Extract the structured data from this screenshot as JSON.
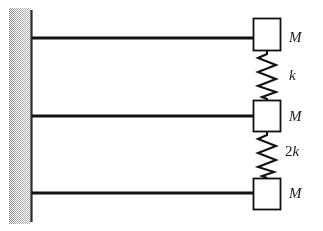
{
  "figure": {
    "background_color": "#ffffff",
    "ink_color": "#111111",
    "wall_hatch_color": "#9a9a9a",
    "width": 323,
    "height": 231
  },
  "wall": {
    "name": "fixed-wall",
    "line_x": 31,
    "line_top": 10,
    "line_bottom": 222,
    "hatch_side": "left",
    "hatch_width": 22
  },
  "rods": [
    {
      "label": "top-rod",
      "y": 38,
      "x_start": 31,
      "x_end": 270
    },
    {
      "label": "middle-rod",
      "y": 116,
      "x_start": 31,
      "x_end": 270
    },
    {
      "label": "bottom-rod",
      "y": 193,
      "x_start": 31,
      "x_end": 270
    }
  ],
  "masses": [
    {
      "id": "mass-top",
      "label": "M",
      "box": {
        "x": 253,
        "y": 18,
        "width": 28,
        "height": 33
      },
      "label_pos": {
        "x": 289,
        "y": 30
      }
    },
    {
      "id": "mass-middle",
      "label": "M",
      "box": {
        "x": 253,
        "y": 100,
        "width": 28,
        "height": 32
      },
      "label_pos": {
        "x": 289,
        "y": 109
      }
    },
    {
      "id": "mass-bottom",
      "label": "M",
      "box": {
        "x": 253,
        "y": 178,
        "width": 28,
        "height": 32
      },
      "label_pos": {
        "x": 289,
        "y": 186
      }
    }
  ],
  "springs": [
    {
      "id": "spring-upper",
      "coefficient": "",
      "stiffness": "k",
      "from": "mass-top",
      "to": "mass-middle",
      "x_center": 268,
      "y_top": 51,
      "y_bottom": 100,
      "coils": 7,
      "amplitude": 10,
      "label_pos": {
        "x": 289,
        "y": 68
      }
    },
    {
      "id": "spring-lower",
      "coefficient": "2",
      "stiffness": "k",
      "from": "mass-middle",
      "to": "mass-bottom",
      "x_center": 268,
      "y_top": 132,
      "y_bottom": 178,
      "coils": 7,
      "amplitude": 10,
      "label_pos": {
        "x": 285,
        "y": 144
      }
    }
  ]
}
